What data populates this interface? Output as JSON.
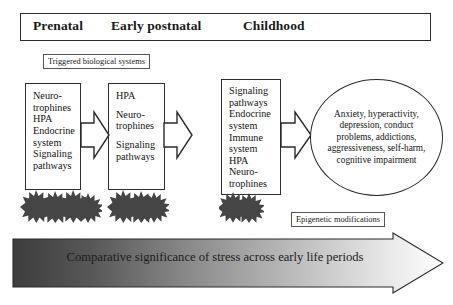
{
  "figure": {
    "periods": {
      "box_label": "period-band",
      "items": [
        {
          "label": "Prenatal"
        },
        {
          "label": "Early postnatal"
        },
        {
          "label": "Childhood"
        }
      ]
    },
    "captions": {
      "triggered": "Triggered biological systems",
      "epigenetic": "Epigenetic modifications"
    },
    "stages": [
      {
        "id": "prenatal",
        "lines": [
          "Neuro-",
          "trophines",
          "HPA",
          "Endocrine",
          "system",
          "Signaling",
          "pathways"
        ],
        "gaps_after": []
      },
      {
        "id": "early-postnatal",
        "lines": [
          "HPA",
          "Neuro-",
          "trophines",
          "Signaling",
          "pathways"
        ],
        "gaps_after": [
          0,
          2
        ]
      },
      {
        "id": "childhood",
        "lines": [
          "Signaling",
          "pathways",
          "Endocrine",
          "system",
          "Immune",
          "system",
          "HPA",
          "Neuro-",
          "trophines"
        ],
        "gaps_after": []
      }
    ],
    "outcome": {
      "text": "Anxiety, hyperactivity, depression, conduct problems, addictions, aggressiveness, self-harm, cognitive impairment"
    },
    "bottom_arrow": {
      "label": "Comparative significance of stress across early life periods",
      "gradient_from": "#3d3d3d",
      "gradient_to": "#ffffff",
      "outline": "#2a2a2a"
    },
    "bursts": [
      {
        "id": "burst-prenatal",
        "count": 4
      },
      {
        "id": "burst-postnatal",
        "count": 3
      },
      {
        "id": "burst-childhood",
        "count": 2
      }
    ],
    "colors": {
      "burst_fill": "#454545",
      "line": "#2a2a2a",
      "background": "#ffffff"
    }
  }
}
